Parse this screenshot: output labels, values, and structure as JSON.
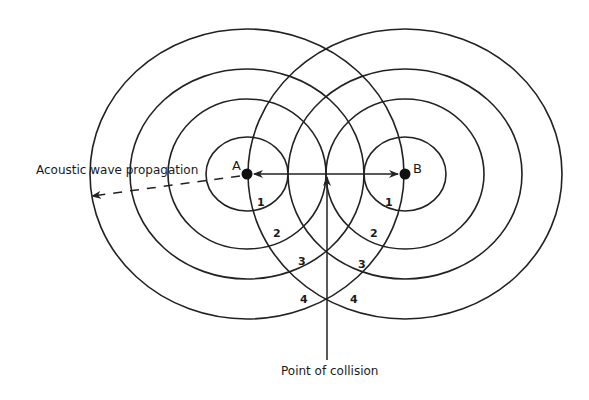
{
  "diagram": {
    "colors": {
      "line": "#222222",
      "background": "#ffffff"
    },
    "sources": [
      {
        "id": "A",
        "label": "A",
        "cx": 247,
        "cy": 174
      },
      {
        "id": "B",
        "label": "B",
        "cx": 405,
        "cy": 174
      }
    ],
    "rings": [
      {
        "index": 1,
        "label": "1",
        "rx": 41,
        "ry": 37
      },
      {
        "index": 2,
        "label": "2",
        "rx": 79,
        "ry": 75
      },
      {
        "index": 3,
        "label": "3",
        "rx": 117,
        "ry": 105
      },
      {
        "index": 4,
        "label": "4",
        "rx": 157,
        "ry": 145
      }
    ],
    "ring_labels_left": [
      "1",
      "2",
      "3",
      "4"
    ],
    "ring_labels_right": [
      "1",
      "2",
      "3",
      "4"
    ],
    "annotations": {
      "propagation": "Acoustic wave propagation",
      "collision": "Point of collision"
    }
  }
}
